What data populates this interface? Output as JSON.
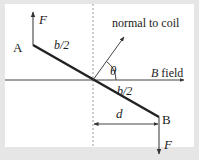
{
  "diagram": {
    "labels": {
      "point_a": "A",
      "point_b": "B",
      "force_top": "F",
      "force_bottom": "F",
      "half_length_top": "b/2",
      "half_length_bottom": "b/2",
      "normal": "normal to coil",
      "angle": "θ",
      "field_var": "B",
      "field_word": " field",
      "distance": "d"
    },
    "colors": {
      "frame": "#e6e6e6",
      "panel": "#ffffff",
      "coil": "#222222",
      "lines": "#444444",
      "dashed": "#9a9a9a"
    }
  }
}
